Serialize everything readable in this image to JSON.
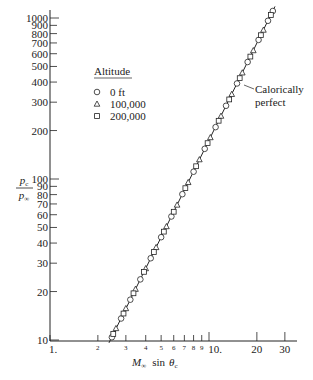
{
  "chart_data": {
    "type": "scatter",
    "title": "",
    "xlabel": "M∞ sin θc",
    "ylabel": "pc / p∞",
    "xscale": "log",
    "yscale": "log",
    "xlim": [
      1,
      32
    ],
    "ylim": [
      10,
      1100
    ],
    "grid": false,
    "x_ticks": [
      {
        "value": 1,
        "label": "1."
      },
      {
        "value": 2,
        "label": "2"
      },
      {
        "value": 3,
        "label": "3"
      },
      {
        "value": 4,
        "label": "4"
      },
      {
        "value": 5,
        "label": "5"
      },
      {
        "value": 6,
        "label": "6"
      },
      {
        "value": 7,
        "label": "7"
      },
      {
        "value": 8,
        "label": "8"
      },
      {
        "value": 9,
        "label": "9"
      },
      {
        "value": 10,
        "label": "10."
      },
      {
        "value": 20,
        "label": "20"
      },
      {
        "value": 30,
        "label": "30"
      }
    ],
    "y_ticks": [
      {
        "value": 10,
        "label": "10"
      },
      {
        "value": 20,
        "label": "20"
      },
      {
        "value": 30,
        "label": "30"
      },
      {
        "value": 40,
        "label": "40"
      },
      {
        "value": 50,
        "label": "50"
      },
      {
        "value": 60,
        "label": "60"
      },
      {
        "value": 70,
        "label": "70"
      },
      {
        "value": 80,
        "label": "80"
      },
      {
        "value": 90,
        "label": "90"
      },
      {
        "value": 100,
        "label": "100"
      },
      {
        "value": 200,
        "label": "200"
      },
      {
        "value": 300,
        "label": "300"
      },
      {
        "value": 400,
        "label": "400"
      },
      {
        "value": 500,
        "label": "500"
      },
      {
        "value": 600,
        "label": "600"
      },
      {
        "value": 700,
        "label": "700"
      },
      {
        "value": 800,
        "label": "800"
      },
      {
        "value": 900,
        "label": "900"
      },
      {
        "value": 1000,
        "label": "1000"
      }
    ],
    "legend": {
      "title": "Altitude",
      "position": "upper-left",
      "entries": [
        {
          "marker": "circle",
          "label": "0 ft"
        },
        {
          "marker": "triangle",
          "label": "100,000"
        },
        {
          "marker": "square",
          "label": "200,000"
        }
      ]
    },
    "line": {
      "name": "Calorically perfect",
      "x": [
        2.35,
        26.0
      ],
      "y": [
        9.6,
        1180
      ]
    },
    "annotations": [
      {
        "text_lines": [
          "Calorically",
          "perfect"
        ],
        "points_to": "line",
        "x": 17.5,
        "y": 430
      }
    ],
    "series": [
      {
        "name": "0 ft",
        "marker": "circle",
        "x": [
          2.45,
          2.8,
          3.2,
          3.7,
          4.3,
          5.0,
          5.8,
          6.8,
          8.0,
          9.4,
          11.0,
          12.8,
          15.0,
          17.5,
          20.5,
          23.5,
          25.2
        ],
        "y": [
          10.4,
          13.6,
          17.8,
          23.8,
          32.2,
          43.5,
          58.5,
          80.5,
          111,
          154,
          210,
          285,
          392,
          533,
          731,
          961,
          1105
        ]
      },
      {
        "name": "100,000",
        "marker": "triangle",
        "x": [
          2.6,
          3.0,
          3.45,
          4.0,
          4.65,
          5.4,
          6.3,
          7.4,
          8.7,
          10.2,
          11.9,
          13.9,
          16.2,
          19.0,
          22.0
        ],
        "y": [
          11.8,
          15.7,
          20.7,
          27.8,
          37.6,
          50.7,
          69,
          95.3,
          132,
          181,
          246,
          336,
          457,
          628,
          842
        ]
      },
      {
        "name": "200,000",
        "marker": "square",
        "x": [
          2.5,
          2.9,
          3.35,
          3.9,
          4.5,
          5.2,
          6.0,
          7.1,
          8.3,
          9.8,
          11.5,
          13.4,
          15.6,
          18.2,
          21.2,
          24.5
        ],
        "y": [
          10.9,
          14.6,
          19.5,
          26.5,
          35.2,
          47.1,
          62.6,
          87.7,
          120,
          167,
          230,
          312,
          423,
          576,
          782,
          1044
        ]
      }
    ]
  }
}
